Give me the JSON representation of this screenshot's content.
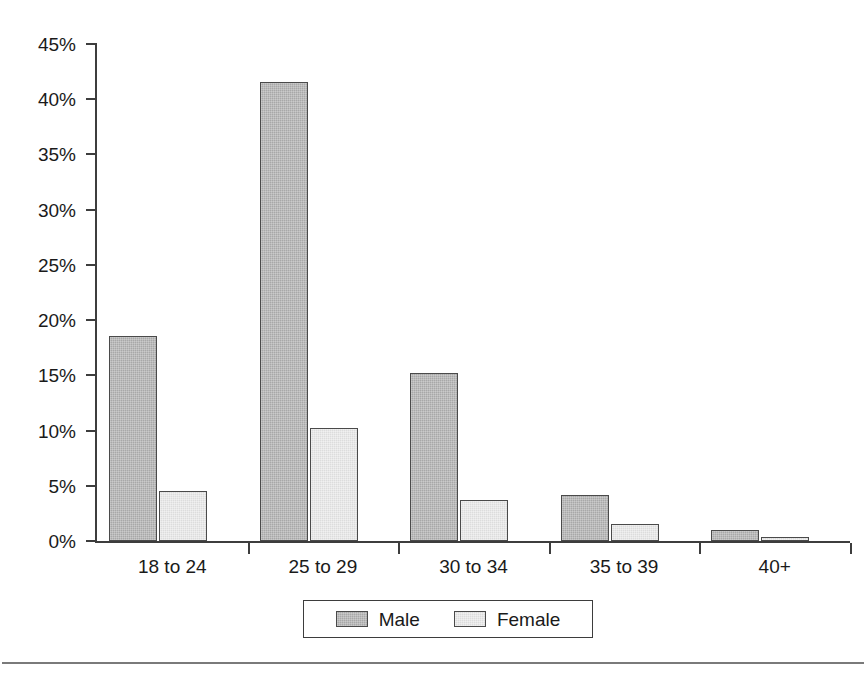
{
  "chart_data": {
    "type": "bar",
    "title": "",
    "subtitle": "",
    "xlabel": "",
    "ylabel": "",
    "categories": [
      "18 to 24",
      "25 to 29",
      "30 to 34",
      "35 to 39",
      "40+"
    ],
    "series": [
      {
        "name": "Male",
        "color": "#a8a8a8",
        "values": [
          18.6,
          41.6,
          15.2,
          4.2,
          1.0
        ]
      },
      {
        "name": "Female",
        "color": "#dcdcdc",
        "values": [
          4.5,
          10.2,
          3.7,
          1.5,
          0.4
        ]
      }
    ],
    "ylim": [
      0,
      45
    ],
    "ytick_step": 5,
    "ytick_labels": [
      "0%",
      "5%",
      "10%",
      "15%",
      "20%",
      "25%",
      "30%",
      "35%",
      "40%",
      "45%"
    ],
    "ytick_values": [
      0,
      5,
      10,
      15,
      20,
      25,
      30,
      35,
      40,
      45
    ],
    "value_format": "percent",
    "grid": false,
    "legend_position": "bottom",
    "axis_color": "#3d3d3d",
    "bar_border_color": "#4a4a4a",
    "background": "#ffffff"
  },
  "legend": {
    "entries": [
      {
        "label": "Male"
      },
      {
        "label": "Female"
      }
    ]
  }
}
